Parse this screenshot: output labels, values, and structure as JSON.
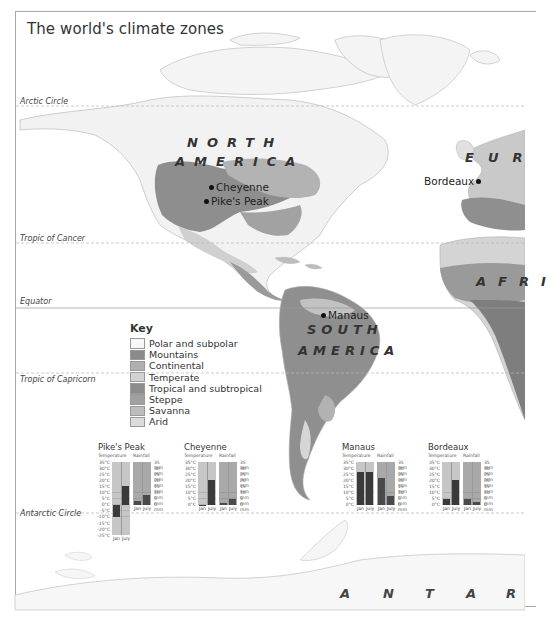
{
  "title": "The world's climate zones",
  "latitude_lines": [
    {
      "label": "Arctic Circle",
      "y": 106
    },
    {
      "label": "Tropic of Cancer",
      "y": 243
    },
    {
      "label": "Equator",
      "y": 308
    },
    {
      "label": "Tropic of Capricorn",
      "y": 373
    },
    {
      "label": "Antarctic Circle",
      "y": 513
    }
  ],
  "regions": {
    "north_america_1": "NORTH",
    "north_america_2": "AMERICA",
    "south_america_1": "SOUTH",
    "south_america_2": "AMERICA",
    "europe": "EUR",
    "africa": "AFRI",
    "antarctica": [
      "A",
      "N",
      "T",
      "A",
      "R"
    ]
  },
  "cities": [
    {
      "name": "Cheyenne"
    },
    {
      "name": "Pike's Peak"
    },
    {
      "name": "Bordeaux"
    },
    {
      "name": "Manaus"
    }
  ],
  "key": {
    "title": "Key",
    "items": [
      {
        "label": "Polar and subpolar",
        "color": "#f7f7f7"
      },
      {
        "label": "Mountains",
        "color": "#8a8a8a"
      },
      {
        "label": "Continental",
        "color": "#b0b0b0"
      },
      {
        "label": "Temperate",
        "color": "#d2d2d2"
      },
      {
        "label": "Tropical and subtropical",
        "color": "#8c8c8c"
      },
      {
        "label": "Steppe",
        "color": "#a0a0a0"
      },
      {
        "label": "Savanna",
        "color": "#bdbdbd"
      },
      {
        "label": "Arid",
        "color": "#dcdcdc"
      }
    ]
  },
  "climate_charts_labels": {
    "temperature": "Temperature",
    "rainfall": "Rainfall",
    "jan": "Jan",
    "july": "July"
  },
  "chart_data": [
    {
      "type": "bar",
      "title": "Pike's Peak",
      "categories": [
        "Jan",
        "July"
      ],
      "series": [
        {
          "name": "Temperature (°C)",
          "values": [
            -10,
            15
          ]
        },
        {
          "name": "Rainfall (mm)",
          "values": [
            3,
            8
          ]
        }
      ],
      "temp_ticks": [
        "35°C",
        "30°C",
        "25°C",
        "20°C",
        "15°C",
        "10°C",
        "5°C",
        "0°C",
        "-5°C",
        "-10°C",
        "-15°C",
        "-20°C",
        "-25°C"
      ],
      "rain_ticks": [
        "35 mm",
        "30 mm",
        "25 mm",
        "20 mm",
        "15 mm",
        "10 mm",
        "5 mm",
        "0 mm"
      ],
      "temp_ylim": [
        -25,
        35
      ],
      "rain_ylim": [
        0,
        35
      ]
    },
    {
      "type": "bar",
      "title": "Cheyenne",
      "categories": [
        "Jan",
        "July"
      ],
      "series": [
        {
          "name": "Temperature (°C)",
          "values": [
            -1,
            20
          ]
        },
        {
          "name": "Rainfall (mm)",
          "values": [
            1,
            5
          ]
        }
      ],
      "temp_ticks": [
        "35°C",
        "30°C",
        "25°C",
        "20°C",
        "15°C",
        "10°C",
        "5°C",
        "0°C"
      ],
      "rain_ticks": [
        "35 mm",
        "30 mm",
        "25 mm",
        "20 mm",
        "15 mm",
        "10 mm",
        "5 mm",
        "0 mm"
      ],
      "temp_ylim": [
        0,
        35
      ],
      "rain_ylim": [
        0,
        35
      ]
    },
    {
      "type": "bar",
      "title": "Manaus",
      "categories": [
        "Jan",
        "July"
      ],
      "series": [
        {
          "name": "Temperature (°C)",
          "values": [
            27,
            27
          ]
        },
        {
          "name": "Rainfall (mm)",
          "values": [
            22,
            7
          ]
        }
      ],
      "temp_ticks": [
        "35°C",
        "30°C",
        "25°C",
        "20°C",
        "15°C",
        "10°C",
        "5°C",
        "0°C"
      ],
      "rain_ticks": [
        "35 mm",
        "30 mm",
        "25 mm",
        "20 mm",
        "15 mm",
        "10 mm",
        "5 mm",
        "0 mm"
      ],
      "temp_ylim": [
        0,
        35
      ],
      "rain_ylim": [
        0,
        35
      ]
    },
    {
      "type": "bar",
      "title": "Bordeaux",
      "categories": [
        "Jan",
        "July"
      ],
      "series": [
        {
          "name": "Temperature (°C)",
          "values": [
            5,
            20
          ]
        },
        {
          "name": "Rainfall (mm)",
          "values": [
            5,
            2
          ]
        }
      ],
      "temp_ticks": [
        "35°C",
        "30°C",
        "25°C",
        "20°C",
        "15°C",
        "10°C",
        "5°C",
        "0°C"
      ],
      "rain_ticks": [
        "35 mm",
        "30 mm",
        "25 mm",
        "20 mm",
        "15 mm",
        "10 mm",
        "5 mm",
        "0 mm"
      ],
      "temp_ylim": [
        0,
        35
      ],
      "rain_ylim": [
        0,
        35
      ]
    }
  ]
}
